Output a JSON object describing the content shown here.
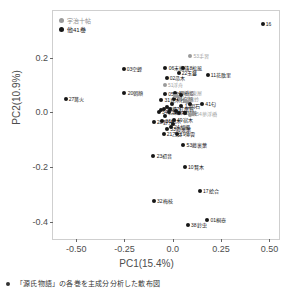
{
  "chart_data": {
    "type": "scatter",
    "title": "",
    "xlabel": "PC1(15.4%)",
    "ylabel": "PC2(10.9%)",
    "xlim": [
      -0.62,
      0.56
    ],
    "ylim": [
      -0.47,
      0.37
    ],
    "xticks": [
      "-0.50",
      "-0.25",
      "0.0",
      "0.25",
      "0.50"
    ],
    "xtickvals": [
      -0.5,
      -0.25,
      0.0,
      0.25,
      0.5
    ],
    "yticks": [
      "0.2",
      "0.0",
      "-0.2",
      "-0.4"
    ],
    "ytickvals": [
      0.2,
      0.0,
      -0.2,
      -0.4
    ],
    "grid": false,
    "legend_position": "top-left-inside",
    "legend": [
      {
        "label": "宇治十帖",
        "color": "#9a9a9a",
        "group": "uji"
      },
      {
        "label": "他41巻",
        "color": "#161616",
        "group": "other"
      }
    ],
    "colors": {
      "uji": "#9a9a9a",
      "other": "#161616",
      "panel_border": "#cfcfcf",
      "axis_text": "#4d4d4d"
    },
    "points": [
      {
        "label": "16",
        "x": 0.465,
        "y": 0.323,
        "group": "other",
        "lab_side": "right"
      },
      {
        "label": "53手習",
        "x": 0.09,
        "y": 0.205,
        "group": "uji",
        "lab_side": "right"
      },
      {
        "label": "03空蝉",
        "x": -0.255,
        "y": 0.16,
        "group": "other",
        "lab_side": "right"
      },
      {
        "label": "06末摘花",
        "x": -0.038,
        "y": 0.163,
        "group": "other",
        "lab_side": "right"
      },
      {
        "label": "18松風",
        "x": 0.055,
        "y": 0.162,
        "group": "other",
        "lab_side": "right"
      },
      {
        "label": "22玉鬘",
        "x": 0.03,
        "y": 0.145,
        "group": "other",
        "lab_side": "right"
      },
      {
        "label": "11花散里",
        "x": 0.18,
        "y": 0.138,
        "group": "other",
        "lab_side": "right"
      },
      {
        "label": "02帚木",
        "x": -0.032,
        "y": 0.125,
        "group": "other",
        "lab_side": "right"
      },
      {
        "label": "51浮舟",
        "x": -0.042,
        "y": 0.098,
        "group": "uji",
        "lab_side": "right"
      },
      {
        "label": "20朝顔",
        "x": -0.25,
        "y": 0.07,
        "group": "other",
        "lab_side": "right"
      },
      {
        "label": "05若紫",
        "x": -0.04,
        "y": 0.068,
        "group": "other",
        "lab_side": "right"
      },
      {
        "label": "45橋姫",
        "x": 0.012,
        "y": 0.07,
        "group": "other",
        "lab_side": "right"
      },
      {
        "label": "50東屋",
        "x": 0.055,
        "y": 0.072,
        "group": "uji",
        "lab_side": "right"
      },
      {
        "label": "27篝火",
        "x": -0.555,
        "y": 0.048,
        "group": "other",
        "lab_side": "right"
      },
      {
        "label": "31真木柱",
        "x": -0.06,
        "y": 0.045,
        "group": "other",
        "lab_side": "right"
      },
      {
        "label": "04夕顔",
        "x": 0.005,
        "y": 0.05,
        "group": "other",
        "lab_side": "right"
      },
      {
        "label": "52蜻蛉",
        "x": 0.038,
        "y": 0.048,
        "group": "uji",
        "lab_side": "right"
      },
      {
        "label": "41匂",
        "x": 0.152,
        "y": 0.03,
        "group": "other",
        "lab_side": "right"
      },
      {
        "label": "13明石",
        "x": 0.045,
        "y": 0.022,
        "group": "other",
        "lab_side": "right"
      },
      {
        "label": "09葵",
        "x": -0.048,
        "y": 0.012,
        "group": "other",
        "lab_side": "right"
      },
      {
        "label": "07紅葉賀",
        "x": -0.012,
        "y": 0.012,
        "group": "other",
        "lab_side": "right"
      },
      {
        "label": "34若菜",
        "x": -0.072,
        "y": 0.002,
        "group": "other",
        "lab_side": "right"
      },
      {
        "label": "35柏木",
        "x": -0.022,
        "y": 0.0,
        "group": "other",
        "lab_side": "right"
      },
      {
        "label": "48早蕨",
        "x": 0.03,
        "y": -0.002,
        "group": "other",
        "lab_side": "right"
      },
      {
        "label": "54夢浮橋",
        "x": 0.105,
        "y": -0.006,
        "group": "uji",
        "lab_side": "right"
      },
      {
        "label": "28野分",
        "x": -0.098,
        "y": -0.035,
        "group": "other",
        "lab_side": "right"
      },
      {
        "label": "36柏木",
        "x": -0.055,
        "y": -0.03,
        "group": "other",
        "lab_side": "right"
      },
      {
        "label": "49宿木",
        "x": 0.005,
        "y": -0.028,
        "group": "other",
        "lab_side": "right"
      },
      {
        "label": "24胡蝶",
        "x": -0.01,
        "y": -0.052,
        "group": "other",
        "lab_side": "right"
      },
      {
        "label": "33藤裏葉",
        "x": -0.03,
        "y": -0.062,
        "group": "other",
        "lab_side": "right"
      },
      {
        "label": "21乙女",
        "x": -0.048,
        "y": -0.078,
        "group": "other",
        "lab_side": "right"
      },
      {
        "label": "19薄雲",
        "x": 0.02,
        "y": -0.078,
        "group": "other",
        "lab_side": "right"
      },
      {
        "label": "53藤裏葉",
        "x": 0.055,
        "y": -0.118,
        "group": "other",
        "lab_side": "right"
      },
      {
        "label": "23初音",
        "x": -0.1,
        "y": -0.16,
        "group": "other",
        "lab_side": "right"
      },
      {
        "label": "10賢木",
        "x": 0.062,
        "y": -0.198,
        "group": "other",
        "lab_side": "right"
      },
      {
        "label": "17絵合",
        "x": 0.14,
        "y": -0.288,
        "group": "other",
        "lab_side": "right"
      },
      {
        "label": "32梅枝",
        "x": -0.098,
        "y": -0.325,
        "group": "other",
        "lab_side": "right"
      },
      {
        "label": "01桐壺",
        "x": 0.178,
        "y": -0.392,
        "group": "other",
        "lab_side": "right"
      },
      {
        "label": "38鈴虫",
        "x": 0.078,
        "y": -0.412,
        "group": "other",
        "lab_side": "right"
      },
      {
        "label": "",
        "x": 0.01,
        "y": 0.06,
        "group": "uji",
        "lab_side": "none"
      },
      {
        "label": "",
        "x": 0.022,
        "y": 0.058,
        "group": "uji",
        "lab_side": "none"
      },
      {
        "label": "",
        "x": 0.062,
        "y": 0.042,
        "group": "uji",
        "lab_side": "none"
      },
      {
        "label": "",
        "x": 0.072,
        "y": 0.038,
        "group": "uji",
        "lab_side": "none"
      },
      {
        "label": "",
        "x": 0.088,
        "y": 0.03,
        "group": "other",
        "lab_side": "none"
      },
      {
        "label": "",
        "x": -0.002,
        "y": 0.032,
        "group": "other",
        "lab_side": "none"
      },
      {
        "label": "",
        "x": -0.03,
        "y": 0.018,
        "group": "other",
        "lab_side": "none"
      },
      {
        "label": "",
        "x": 0.018,
        "y": 0.004,
        "group": "other",
        "lab_side": "none"
      },
      {
        "label": "",
        "x": 0.062,
        "y": -0.004,
        "group": "other",
        "lab_side": "none"
      },
      {
        "label": "",
        "x": 0.088,
        "y": -0.01,
        "group": "uji",
        "lab_side": "none"
      },
      {
        "label": "",
        "x": -0.04,
        "y": -0.012,
        "group": "other",
        "lab_side": "none"
      },
      {
        "label": "",
        "x": -0.062,
        "y": 0.008,
        "group": "other",
        "lab_side": "none"
      },
      {
        "label": "",
        "x": 0.0,
        "y": -0.042,
        "group": "other",
        "lab_side": "none"
      },
      {
        "label": "",
        "x": 0.042,
        "y": 0.062,
        "group": "other",
        "lab_side": "none"
      }
    ]
  },
  "caption": {
    "text": "「源氏物語」の各巻を主成分分析した散布図",
    "visible_fragment": "「源氏物語」の各巻を主成分分析した散布図"
  }
}
